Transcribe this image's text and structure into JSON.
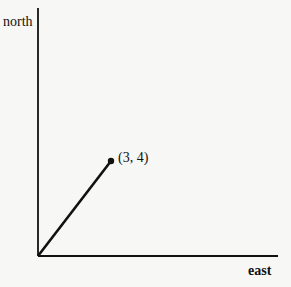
{
  "diagram": {
    "type": "vector",
    "axes": {
      "y_label": "north",
      "x_label": "east"
    },
    "vector": {
      "from": [
        0,
        0
      ],
      "to": [
        3,
        4
      ],
      "endpoint_label": "(3, 4)"
    },
    "colors": {
      "background": "#f7f7f5",
      "ink": "#111111"
    }
  }
}
